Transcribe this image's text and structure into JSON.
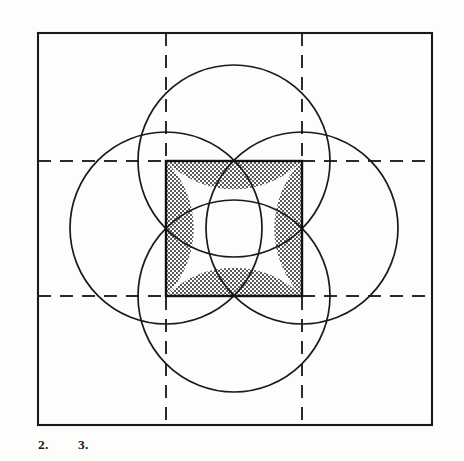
{
  "figure": {
    "canvas": {
      "width": 464,
      "height": 461,
      "background": "#fdfdfb"
    },
    "colors": {
      "stroke": "#1a1a1a",
      "outer_square_stroke": "#1a1a1a",
      "inner_square_stroke": "#111111",
      "circle_stroke": "#1a1a1a",
      "dashed_stroke": "#2b2b2b",
      "shade_fill": "#a9a9a9",
      "shade_pattern": "checker-stipple",
      "background": "#fdfdfb"
    },
    "outer_square": {
      "name": "outer-square",
      "x": 38,
      "y": 33,
      "width": 394,
      "height": 392,
      "stroke_width": 2.1
    },
    "inner_square": {
      "name": "inner-square",
      "x": 166,
      "y": 161,
      "width": 136,
      "height": 135,
      "stroke_width": 2.4
    },
    "circles": [
      {
        "name": "circle-top",
        "cx": 234,
        "cy": 161,
        "r": 96,
        "stroke_width": 1.7
      },
      {
        "name": "circle-right",
        "cx": 302,
        "cy": 228,
        "r": 96,
        "stroke_width": 1.7
      },
      {
        "name": "circle-bottom",
        "cx": 234,
        "cy": 296,
        "r": 96,
        "stroke_width": 1.7
      },
      {
        "name": "circle-left",
        "cx": 166,
        "cy": 228,
        "r": 96,
        "stroke_width": 1.7
      }
    ],
    "dashed_lines": [
      {
        "name": "dashed-horizontal-top",
        "x1": 38,
        "y1": 161,
        "x2": 432,
        "y2": 161
      },
      {
        "name": "dashed-horizontal-bottom",
        "x1": 38,
        "y1": 296,
        "x2": 432,
        "y2": 296
      },
      {
        "name": "dashed-vertical-left",
        "x1": 166,
        "y1": 33,
        "x2": 166,
        "y2": 425
      },
      {
        "name": "dashed-vertical-right",
        "x1": 302,
        "y1": 33,
        "x2": 302,
        "y2": 425
      }
    ],
    "shaded_regions": [
      {
        "name": "shaded-segment-top",
        "description": "region between inner square top edge and downward bulging arc of top circle"
      },
      {
        "name": "shaded-segment-right",
        "description": "region between inner square right edge and leftward bulging arc of right circle"
      },
      {
        "name": "shaded-segment-bottom",
        "description": "region between inner square bottom edge and upward bulging arc of bottom circle"
      },
      {
        "name": "shaded-segment-left",
        "description": "region between inner square left edge and rightward bulging arc of left circle"
      }
    ],
    "captions": [
      {
        "name": "caption-item-2",
        "label": "2."
      },
      {
        "name": "caption-item-3",
        "label": "3."
      }
    ]
  }
}
